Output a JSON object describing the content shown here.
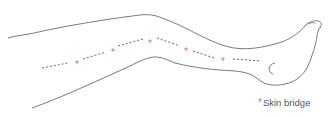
{
  "diagram": {
    "colors": {
      "outline": "#7a7a7a",
      "dotted_line": "#6b6b6b",
      "skin_bridge_marker": "#d4708a"
    },
    "skin_bridges": [
      {
        "x": 77,
        "y": 64
      },
      {
        "x": 113,
        "y": 52
      },
      {
        "x": 150,
        "y": 43
      },
      {
        "x": 186,
        "y": 51
      },
      {
        "x": 223,
        "y": 61
      }
    ]
  },
  "legend": {
    "marker": "*",
    "label": "Skin bridge"
  }
}
